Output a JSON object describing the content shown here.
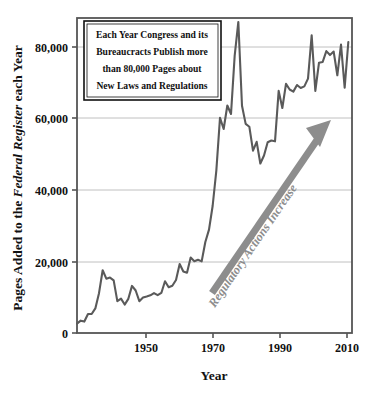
{
  "figure": {
    "background_color": "#ffffff",
    "frame_color": "#555555",
    "grid_color": "#b9b9b9",
    "series_color": "#5a5a5a",
    "arrow_color": "#8d8d8d"
  },
  "axes": {
    "y_title_prefix": "Pages Added to the ",
    "y_title_italic": "Federal Register",
    "y_title_suffix": " each Year",
    "y_title_full": "Pages Added to the Federal Register each Year",
    "x_title": "Year",
    "y_ticks": [
      "0",
      "20,000",
      "40,000",
      "60,000",
      "80,000"
    ],
    "x_ticks": [
      "1950",
      "1970",
      "1990",
      "2010"
    ]
  },
  "annotation": {
    "lines": [
      "Each Year Congress and its",
      "Bureaucracts Publish more",
      "than 80,000 Pages about",
      "New Laws and Regulations"
    ]
  },
  "arrow": {
    "label": "Regulatory Actions Increase"
  },
  "chart_data": {
    "type": "line",
    "title": "",
    "subtitle": "",
    "xlabel": "Year",
    "ylabel": "Pages Added to the Federal Register each Year",
    "xlim": [
      1936,
      2011
    ],
    "ylim": [
      0,
      90000
    ],
    "yticks": [
      0,
      20000,
      40000,
      60000,
      80000
    ],
    "ytick_labels": [
      "0",
      "20,000",
      "40,000",
      "60,000",
      "80,000"
    ],
    "xticks": [
      1950,
      1970,
      1990,
      2010
    ],
    "xtick_labels": [
      "1950",
      "1970",
      "1990",
      "2010"
    ],
    "grid": "horizontal",
    "legend": "none",
    "annotations": [
      {
        "kind": "text-box",
        "text": "Each Year Congress and its Bureaucracts Publish more than 80,000 Pages about New Laws and Regulations",
        "position": "top-left"
      },
      {
        "kind": "arrow",
        "text": "Regulatory Actions Increase",
        "from": [
          1970,
          11000
        ],
        "to": [
          2005,
          60000
        ]
      }
    ],
    "series": [
      {
        "name": "Pages added to the Federal Register",
        "x": [
          1936,
          1937,
          1938,
          1939,
          1940,
          1941,
          1942,
          1943,
          1944,
          1945,
          1946,
          1947,
          1948,
          1949,
          1950,
          1951,
          1952,
          1953,
          1954,
          1955,
          1956,
          1957,
          1958,
          1959,
          1960,
          1961,
          1962,
          1963,
          1964,
          1965,
          1966,
          1967,
          1968,
          1969,
          1970,
          1971,
          1972,
          1973,
          1974,
          1975,
          1976,
          1977,
          1978,
          1979,
          1980,
          1981,
          1982,
          1983,
          1984,
          1985,
          1986,
          1987,
          1988,
          1989,
          1990,
          1991,
          1992,
          1993,
          1994,
          1995,
          1996,
          1997,
          1998,
          1999,
          2000,
          2001,
          2002,
          2003,
          2004,
          2005,
          2006,
          2007,
          2008,
          2009,
          2010
        ],
        "y": [
          2620,
          3450,
          3194,
          5307,
          5307,
          6877,
          11134,
          17553,
          15194,
          15508,
          14736,
          8902,
          9608,
          7952,
          9562,
          13175,
          11896,
          8912,
          9910,
          10196,
          10528,
          11156,
          10579,
          11203,
          14479,
          12792,
          13226,
          14842,
          19304,
          17206,
          16850,
          21087,
          20068,
          20464,
          20036,
          25442,
          28924,
          35592,
          45422,
          60221,
          57072,
          63629,
          61261,
          77498,
          87012,
          63554,
          58494,
          57704,
          50998,
          53480,
          47418,
          49654,
          53376,
          53842,
          53620,
          67716,
          62928,
          69688,
          68108,
          67518,
          69368,
          68530,
          68985,
          71161,
          83294,
          67702,
          75606,
          75795,
          78851,
          77752,
          78724,
          72090,
          80700,
          68598,
          81405
        ]
      }
    ]
  }
}
